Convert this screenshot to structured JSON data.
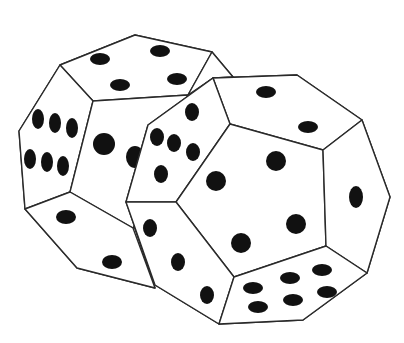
{
  "image": {
    "description": "Line drawing of two twelve-sided (dodecahedral) dice with black pips",
    "background": "#ffffff",
    "line_color": "#2a2a2a",
    "pip_color": "#111111"
  },
  "dice": [
    {
      "name": "back-die",
      "visible_faces": [
        4,
        6,
        2,
        2,
        1
      ]
    },
    {
      "name": "front-die",
      "visible_faces": [
        2,
        4,
        5,
        1,
        3,
        6
      ]
    }
  ]
}
